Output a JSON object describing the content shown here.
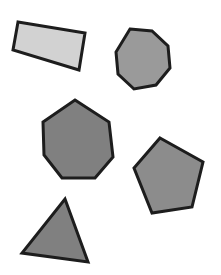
{
  "canvas": {
    "width": 221,
    "height": 275,
    "background_color": "#ffffff",
    "description": "Five outlined geometric polygons scattered on a plain white field"
  },
  "style": {
    "outline_color": "#1d1d1d",
    "outline_width": 3,
    "light_fill": "#d2d2d2",
    "mid_light_fill": "#9a9a9a",
    "mid_fill": "#8c8c8c",
    "dark_fill": "#808080"
  },
  "shapes": [
    {
      "id": "rectangle",
      "name": "rectangle",
      "sides": 4,
      "fill_color": "#d2d2d2",
      "stroke_color": "#1d1d1d",
      "stroke_width": 3,
      "position": "top-left",
      "rotation_deg": 10,
      "points": "18,22 85,33 79,70 13,50",
      "center": {
        "x": 49,
        "y": 44
      },
      "bbox": {
        "x": 13,
        "y": 22,
        "width": 72,
        "height": 48
      }
    },
    {
      "id": "octagon",
      "name": "octagon",
      "sides": 8,
      "fill_color": "#9a9a9a",
      "stroke_color": "#1d1d1d",
      "stroke_width": 3,
      "position": "top-right",
      "rotation_deg": 0,
      "points": "130,29 152,31 168,46 170,68 156,85 134,89 118,74 116,52",
      "center": {
        "x": 143,
        "y": 59
      },
      "bbox": {
        "x": 116,
        "y": 29,
        "width": 54,
        "height": 60
      }
    },
    {
      "id": "heptagon",
      "name": "heptagon",
      "sides": 7,
      "fill_color": "#808080",
      "stroke_color": "#1d1d1d",
      "stroke_width": 3,
      "position": "middle-left",
      "rotation_deg": 0,
      "points": "75,100 109,122 113,157 95,178 62,178 44,155 43,122",
      "center": {
        "x": 77,
        "y": 140
      },
      "bbox": {
        "x": 43,
        "y": 100,
        "width": 70,
        "height": 78
      }
    },
    {
      "id": "pentagon",
      "name": "pentagon",
      "sides": 5,
      "fill_color": "#8c8c8c",
      "stroke_color": "#1d1d1d",
      "stroke_width": 3,
      "position": "middle-right",
      "rotation_deg": -15,
      "points": "160,138 203,162 192,207 152,213 134,168",
      "center": {
        "x": 170,
        "y": 177
      },
      "bbox": {
        "x": 134,
        "y": 138,
        "width": 69,
        "height": 75
      }
    },
    {
      "id": "triangle",
      "name": "triangle",
      "sides": 3,
      "fill_color": "#808080",
      "stroke_color": "#1d1d1d",
      "stroke_width": 3,
      "position": "bottom-left",
      "rotation_deg": 0,
      "points": "65,199 88,262 22,253",
      "center": {
        "x": 58,
        "y": 238
      },
      "bbox": {
        "x": 22,
        "y": 199,
        "width": 66,
        "height": 63
      }
    }
  ]
}
